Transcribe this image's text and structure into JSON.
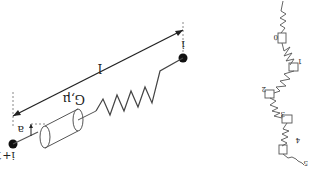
{
  "diagram": {
    "orientation": "rotated-180",
    "left_panel": {
      "labels": {
        "node_i": "i",
        "node_i_plus_1": "i+1",
        "length": "l",
        "radius": "a",
        "material": "G,μ"
      },
      "elements": [
        "bead-i",
        "bead-i+1",
        "spring",
        "dashpot-cylinder",
        "length-arrow",
        "radius-arrow"
      ]
    },
    "right_panel": {
      "chain_labels": [
        "0",
        "1",
        "2",
        "3",
        "4",
        "5"
      ],
      "description": "chain of beads connected by spring-dashpot units"
    },
    "colors": {
      "line": "#333333",
      "bead": "#111111",
      "dashed": "#888888"
    }
  }
}
